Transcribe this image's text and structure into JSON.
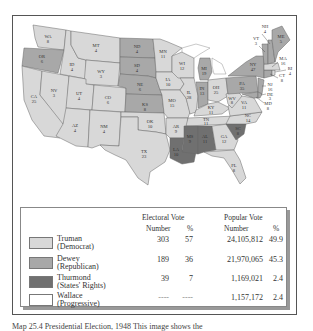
{
  "colors": {
    "truman": "#d8d8d8",
    "dewey": "#a8a8a8",
    "thurmond": "#707070",
    "wallace": "#ffffff",
    "water": "#ffffff",
    "border": "#555555"
  },
  "map": {
    "states": [
      {
        "abbr": "WA",
        "votes": "8",
        "party": "truman"
      },
      {
        "abbr": "OR",
        "votes": "6",
        "party": "dewey"
      },
      {
        "abbr": "CA",
        "votes": "25",
        "party": "truman"
      },
      {
        "abbr": "ID",
        "votes": "4",
        "party": "truman"
      },
      {
        "abbr": "NV",
        "votes": "3",
        "party": "truman"
      },
      {
        "abbr": "MT",
        "votes": "4",
        "party": "truman"
      },
      {
        "abbr": "WY",
        "votes": "3",
        "party": "truman"
      },
      {
        "abbr": "UT",
        "votes": "4",
        "party": "truman"
      },
      {
        "abbr": "CO",
        "votes": "6",
        "party": "truman"
      },
      {
        "abbr": "AZ",
        "votes": "4",
        "party": "truman"
      },
      {
        "abbr": "NM",
        "votes": "4",
        "party": "truman"
      },
      {
        "abbr": "ND",
        "votes": "4",
        "party": "dewey"
      },
      {
        "abbr": "SD",
        "votes": "4",
        "party": "dewey"
      },
      {
        "abbr": "NE",
        "votes": "6",
        "party": "dewey"
      },
      {
        "abbr": "KS",
        "votes": "8",
        "party": "dewey"
      },
      {
        "abbr": "OK",
        "votes": "10",
        "party": "truman"
      },
      {
        "abbr": "TX",
        "votes": "23",
        "party": "truman"
      },
      {
        "abbr": "MN",
        "votes": "11",
        "party": "truman"
      },
      {
        "abbr": "IA",
        "votes": "10",
        "party": "truman"
      },
      {
        "abbr": "MO",
        "votes": "15",
        "party": "truman"
      },
      {
        "abbr": "AR",
        "votes": "9",
        "party": "truman"
      },
      {
        "abbr": "LA",
        "votes": "10",
        "party": "thurmond"
      },
      {
        "abbr": "WI",
        "votes": "12",
        "party": "truman"
      },
      {
        "abbr": "IL",
        "votes": "28",
        "party": "truman"
      },
      {
        "abbr": "MI",
        "votes": "19",
        "party": "dewey"
      },
      {
        "abbr": "IN",
        "votes": "13",
        "party": "dewey"
      },
      {
        "abbr": "OH",
        "votes": "25",
        "party": "truman"
      },
      {
        "abbr": "KY",
        "votes": "11",
        "party": "truman"
      },
      {
        "abbr": "TN",
        "votes": "11",
        "party": "truman"
      },
      {
        "abbr": "MS",
        "votes": "9",
        "party": "thurmond"
      },
      {
        "abbr": "AL",
        "votes": "11",
        "party": "thurmond"
      },
      {
        "abbr": "GA",
        "votes": "12",
        "party": "truman"
      },
      {
        "abbr": "FL",
        "votes": "8",
        "party": "truman"
      },
      {
        "abbr": "SC",
        "votes": "8",
        "party": "thurmond"
      },
      {
        "abbr": "NC",
        "votes": "14",
        "party": "truman"
      },
      {
        "abbr": "VA",
        "votes": "11",
        "party": "truman"
      },
      {
        "abbr": "WV",
        "votes": "8",
        "party": "truman"
      },
      {
        "abbr": "PA",
        "votes": "35",
        "party": "dewey"
      },
      {
        "abbr": "NY",
        "votes": "47",
        "party": "dewey"
      },
      {
        "abbr": "VT",
        "votes": "3",
        "party": "dewey"
      },
      {
        "abbr": "NH",
        "votes": "4",
        "party": "dewey"
      },
      {
        "abbr": "ME",
        "votes": "5",
        "party": "dewey"
      },
      {
        "abbr": "MA",
        "votes": "16",
        "party": "truman"
      },
      {
        "abbr": "RI",
        "votes": "4",
        "party": "truman"
      },
      {
        "abbr": "CT",
        "votes": "8",
        "party": "dewey"
      },
      {
        "abbr": "NJ",
        "votes": "16",
        "party": "dewey"
      },
      {
        "abbr": "DE",
        "votes": "3",
        "party": "dewey"
      },
      {
        "abbr": "MD",
        "votes": "8",
        "party": "dewey"
      }
    ]
  },
  "legend": {
    "header_electoral": "Electoral Vote",
    "header_popular": "Popular Vote",
    "sub_number": "Number",
    "sub_pct": "%",
    "rows": [
      {
        "name": "Truman",
        "party": "(Democrat)",
        "ev": "303",
        "ev_pct": "57",
        "pv": "24,105,812",
        "pv_pct": "49.9"
      },
      {
        "name": "Dewey",
        "party": "(Republican)",
        "ev": "189",
        "ev_pct": "36",
        "pv": "21,970,065",
        "pv_pct": "45.3"
      },
      {
        "name": "Thurmond",
        "party": "(States' Rights)",
        "ev": "39",
        "ev_pct": "7",
        "pv": "1,169,021",
        "pv_pct": "2.4"
      },
      {
        "name": "Wallace",
        "party": "(Progressive)",
        "ev": "----",
        "ev_pct": "----",
        "pv": "1,157,172",
        "pv_pct": "2.4"
      }
    ]
  },
  "caption": "Map 25.4  Presidential Election, 1948   This image shows the"
}
